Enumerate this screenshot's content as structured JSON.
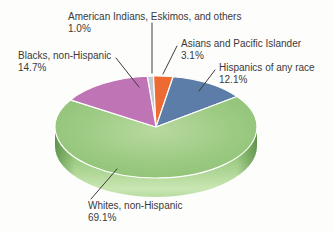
{
  "chart_data": {
    "type": "pie",
    "style": "3d",
    "start_angle_deg": -5,
    "unit": "%",
    "legend_position": "none",
    "labels_style": "callout-lines",
    "slices": [
      {
        "id": "american-indians",
        "label": "American Indians, Eskimos, and others",
        "pct_label": "1.0%",
        "value": 1.0,
        "color": "#c2c8ce"
      },
      {
        "id": "asians",
        "label": "Asians and Pacific Islander",
        "pct_label": "3.1%",
        "value": 3.1,
        "color": "#ee6a33"
      },
      {
        "id": "hispanics",
        "label": "Hispanics of any race",
        "pct_label": "12.1%",
        "value": 12.1,
        "color": "#5c7da7"
      },
      {
        "id": "whites",
        "label": "Whites, non-Hispanic",
        "pct_label": "69.1%",
        "value": 69.1,
        "color": "#9cca82"
      },
      {
        "id": "blacks",
        "label": "Blacks, non-Hispanic",
        "pct_label": "14.7%",
        "value": 14.7,
        "color": "#bf74b5"
      }
    ],
    "colors": {
      "rim_dark": "#7cb565",
      "rim_light": "#c9e6b2",
      "separator": "#ffffff",
      "leader_line": "#3c3c3c",
      "text": "#3a3a3a"
    }
  }
}
